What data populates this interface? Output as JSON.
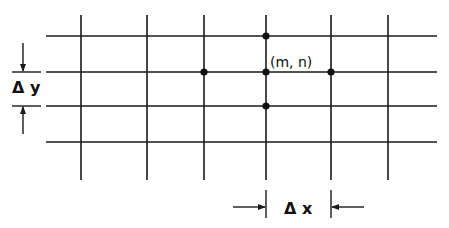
{
  "diagram": {
    "title": "",
    "colors": {
      "ink": "#1a1a1a",
      "background": "#ffffff"
    },
    "grid": {
      "vertical_x": [
        81,
        147,
        204,
        266,
        331,
        388
      ],
      "vertical_y_range": [
        15,
        180
      ],
      "horizontal_y": [
        36,
        72,
        106,
        142
      ],
      "horizontal_x_range": [
        46,
        437
      ]
    },
    "nodes": [
      {
        "id": "m,n+1",
        "x": 266,
        "y": 36
      },
      {
        "id": "m-1,n",
        "x": 204,
        "y": 72
      },
      {
        "id": "m,n",
        "x": 266,
        "y": 72
      },
      {
        "id": "m+1,n",
        "x": 331,
        "y": 72
      },
      {
        "id": "m,n-1",
        "x": 266,
        "y": 106
      }
    ],
    "labels": {
      "center_node": "(m, n)",
      "delta_y": "Δ y",
      "delta_x": "Δ x"
    }
  }
}
